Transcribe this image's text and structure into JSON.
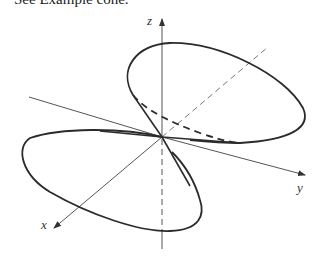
{
  "caption": {
    "visible_text": "See Example cone.",
    "faded_text": "figure equation (partially cut off)"
  },
  "diagram": {
    "axes": {
      "x": {
        "label": "x"
      },
      "y": {
        "label": "y"
      },
      "z": {
        "label": "z"
      }
    },
    "colors": {
      "curve": "#2b2b2b",
      "axis": "#555555",
      "background": "#ffffff"
    },
    "elements": [
      "upper nappe ellipse (solid)",
      "upper nappe hidden edge (dashed)",
      "lower nappe ellipse (solid)",
      "hidden z-axis below origin (dashed)",
      "hidden x-axis behind origin (dashed)"
    ]
  }
}
